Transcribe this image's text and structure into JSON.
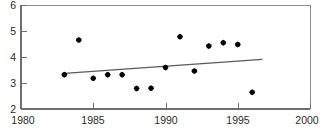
{
  "chart_data": {
    "type": "scatter",
    "title": "",
    "subtitle": "",
    "xlabel": "",
    "ylabel": "",
    "xlim": [
      1980,
      2000
    ],
    "ylim": [
      2,
      6
    ],
    "grid": false,
    "legend": null,
    "legend_position": "none",
    "x_ticks": [
      1980,
      1985,
      1990,
      1995,
      2000
    ],
    "y_ticks": [
      2,
      3,
      4,
      5,
      6
    ],
    "x_tick_labels": [
      "1980",
      "1985",
      "1990",
      "1995",
      "2000"
    ],
    "y_tick_labels": [
      "2",
      "3",
      "4",
      "5",
      "6"
    ],
    "marker_style": "diamond",
    "marker_color": "#000000",
    "series": [
      {
        "name": "observations",
        "x": [
          1983,
          1984,
          1985,
          1986,
          1987,
          1988,
          1989,
          1990,
          1991,
          1992,
          1993,
          1994,
          1995,
          1996
        ],
        "values": [
          3.32,
          4.65,
          3.18,
          3.32,
          3.32,
          2.79,
          2.8,
          3.6,
          4.78,
          3.46,
          4.42,
          4.55,
          4.48,
          2.64
        ]
      }
    ],
    "trend_line": {
      "name": "linear trend",
      "color": "#5a5a5a",
      "x_start": 1983,
      "y_start": 3.37,
      "x_end": 1996.7,
      "y_end": 3.91
    },
    "annotations": []
  },
  "axes": {
    "y_axis_name": "y-axis",
    "x_axis_name": "x-axis"
  }
}
